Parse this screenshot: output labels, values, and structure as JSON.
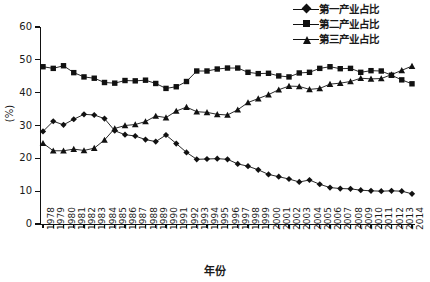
{
  "chart_data": {
    "type": "line",
    "title": "",
    "xlabel": "年份",
    "ylabel": "(%)",
    "ylim": [
      0,
      60
    ],
    "yticks": [
      0,
      10,
      20,
      30,
      40,
      50,
      60
    ],
    "grid": false,
    "legend_position": "top-right",
    "categories": [
      "1978",
      "1979",
      "1980",
      "1981",
      "1982",
      "1983",
      "1984",
      "1985",
      "1986",
      "1987",
      "1988",
      "1989",
      "1990",
      "1991",
      "1992",
      "1993",
      "1994",
      "1995",
      "1996",
      "1997",
      "1998",
      "1999",
      "2000",
      "2001",
      "2002",
      "2003",
      "2004",
      "2005",
      "2006",
      "2007",
      "2008",
      "2009",
      "2010",
      "2011",
      "2012",
      "2013",
      "2014"
    ],
    "series": [
      {
        "name": "第一产业占比",
        "marker": "diamond",
        "values": [
          28.2,
          31.3,
          30.2,
          31.9,
          33.4,
          33.2,
          32.1,
          28.4,
          27.2,
          26.8,
          25.7,
          25.1,
          27.1,
          24.5,
          21.8,
          19.7,
          19.8,
          19.9,
          19.7,
          18.3,
          17.6,
          16.5,
          15.1,
          14.4,
          13.7,
          12.8,
          13.4,
          12.1,
          11.1,
          10.8,
          10.7,
          10.3,
          10.1,
          10.0,
          10.1,
          10.0,
          9.2
        ]
      },
      {
        "name": "第二产业占比",
        "marker": "square",
        "values": [
          47.9,
          47.4,
          48.2,
          46.1,
          44.8,
          44.4,
          43.1,
          42.9,
          43.7,
          43.6,
          43.8,
          42.8,
          41.3,
          41.8,
          43.4,
          46.6,
          46.6,
          47.2,
          47.5,
          47.5,
          46.2,
          45.8,
          45.9,
          45.1,
          44.8,
          46.0,
          46.2,
          47.4,
          47.9,
          47.3,
          47.4,
          46.2,
          46.7,
          46.6,
          45.3,
          43.9,
          42.7
        ]
      },
      {
        "name": "第三产业占比",
        "marker": "triangle",
        "values": [
          24.6,
          22.3,
          22.3,
          22.8,
          22.4,
          23.1,
          25.6,
          29.1,
          30.0,
          30.3,
          31.2,
          32.9,
          32.4,
          34.4,
          35.6,
          34.2,
          34.0,
          33.4,
          33.2,
          34.8,
          37.0,
          38.2,
          39.4,
          40.9,
          42.0,
          41.9,
          41.0,
          41.3,
          42.6,
          42.9,
          43.4,
          44.4,
          44.2,
          44.3,
          45.5,
          46.8,
          48.1
        ]
      }
    ]
  },
  "legend": {
    "items": [
      {
        "label": "第一产业占比",
        "marker": "diamond"
      },
      {
        "label": "第二产业占比",
        "marker": "square"
      },
      {
        "label": "第三产业占比",
        "marker": "triangle"
      }
    ]
  },
  "axes": {
    "y_title": "(%)",
    "x_title": "年份",
    "y_tick_labels": [
      "0",
      "10",
      "20",
      "30",
      "40",
      "50",
      "60"
    ]
  }
}
